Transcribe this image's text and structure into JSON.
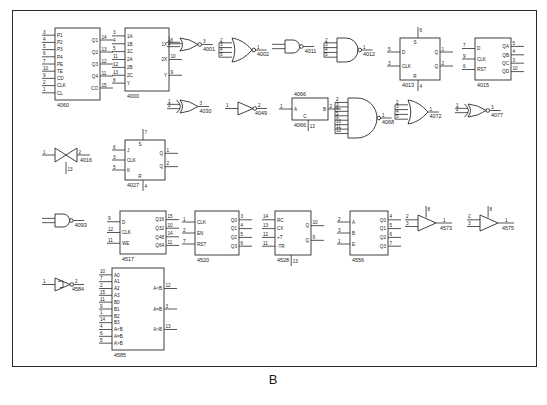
{
  "figure": {
    "caption": "B"
  },
  "components": [
    {
      "id": "u4060",
      "part": "4060",
      "type": "ic-block",
      "x": 55,
      "y": 28,
      "w": 45,
      "h": 72,
      "left_pins": [
        {
          "num": "3",
          "name": "P1"
        },
        {
          "num": "4",
          "name": "P2"
        },
        {
          "num": "5",
          "name": "P3"
        },
        {
          "num": "6",
          "name": "P4"
        },
        {
          "num": "7",
          "name": "PE"
        },
        {
          "num": "10",
          "name": "TE"
        },
        {
          "num": "9",
          "name": "CD"
        },
        {
          "num": "2",
          "name": "CLK"
        },
        {
          "num": "1",
          "name": "CL"
        }
      ],
      "right_pins": [
        {
          "num": "14",
          "name": "Q1"
        },
        {
          "num": "13",
          "name": "Q2"
        },
        {
          "num": "12",
          "name": "Q3"
        },
        {
          "num": "11",
          "name": "Q4"
        },
        {
          "num": "15",
          "name": "CO"
        }
      ]
    },
    {
      "id": "u4000",
      "part": "4000",
      "type": "ic-block",
      "x": 125,
      "y": 28,
      "w": 44,
      "h": 63,
      "left_pins": [
        {
          "num": "3",
          "name": "1A"
        },
        {
          "num": "4",
          "name": "1B"
        },
        {
          "num": "5",
          "name": "1C"
        },
        {
          "num": "11",
          "name": "2A"
        },
        {
          "num": "12",
          "name": "2B"
        },
        {
          "num": "13",
          "name": "2C"
        },
        {
          "num": "8",
          "name": "Y"
        }
      ],
      "right_pins": [
        {
          "num": "6",
          "name": "1X"
        },
        {
          "num": "10",
          "name": "2X"
        },
        {
          "num": "9",
          "name": "Y"
        }
      ]
    },
    {
      "id": "u4001",
      "part": "4001",
      "type": "nor2",
      "x": 180,
      "y": 38,
      "inputs": [
        "1",
        "2"
      ],
      "outputs": [
        "3"
      ]
    },
    {
      "id": "u4002",
      "part": "4002",
      "type": "nor4",
      "x": 232,
      "y": 38,
      "inputs": [
        "2",
        "3",
        "4",
        "5"
      ],
      "outputs": [
        "1"
      ]
    },
    {
      "id": "u4011",
      "part": "4011",
      "type": "nand2",
      "x": 285,
      "y": 40,
      "inputs": [
        "",
        ""
      ],
      "outputs": [
        ""
      ]
    },
    {
      "id": "u4012",
      "part": "4012",
      "type": "nand4",
      "x": 337,
      "y": 38,
      "inputs": [
        "2",
        "3",
        "4",
        "5"
      ],
      "outputs": [
        "1"
      ]
    },
    {
      "id": "u4013",
      "part": "4013",
      "type": "ff-block",
      "x": 400,
      "y": 38,
      "w": 40,
      "h": 42,
      "top_pins": [
        {
          "num": "6",
          "name": "S"
        }
      ],
      "bottom_pins": [
        {
          "num": "4",
          "name": "R"
        }
      ],
      "left_pins": [
        {
          "num": "5",
          "name": "D"
        },
        {
          "num": "3",
          "name": "CLK"
        }
      ],
      "right_pins": [
        {
          "num": "1",
          "name": "Q"
        },
        {
          "num": "2",
          "name": "Q"
        }
      ]
    },
    {
      "id": "u4015",
      "part": "4015",
      "type": "ic-block",
      "x": 475,
      "y": 38,
      "w": 36,
      "h": 42,
      "left_pins": [
        {
          "num": "7",
          "name": "D"
        },
        {
          "num": "9",
          "name": "CLK"
        },
        {
          "num": "6",
          "name": "RST"
        }
      ],
      "right_pins": [
        {
          "num": "5",
          "name": "QA"
        },
        {
          "num": "4",
          "name": "QB"
        },
        {
          "num": "3",
          "name": "QC"
        },
        {
          "num": "10",
          "name": "QD"
        }
      ]
    },
    {
      "id": "u4030",
      "part": "4030",
      "type": "xor2",
      "x": 180,
      "y": 100,
      "inputs": [
        "1",
        "2"
      ],
      "outputs": [
        "3"
      ]
    },
    {
      "id": "u4049",
      "part": "4049",
      "type": "inverter",
      "x": 238,
      "y": 102,
      "inputs": [
        "1"
      ],
      "outputs": [
        "2"
      ]
    },
    {
      "id": "u4066",
      "part": "4066",
      "type": "switch-block",
      "x": 292,
      "y": 98,
      "w": 36,
      "h": 22,
      "left_pins": [
        {
          "num": "1",
          "name": "A"
        }
      ],
      "right_pins": [
        {
          "num": "2",
          "name": "B"
        }
      ],
      "bottom_pins": [
        {
          "num": "13",
          "name": "C"
        }
      ]
    },
    {
      "id": "u4068",
      "part": "4068",
      "type": "nand8",
      "x": 348,
      "y": 98,
      "inputs": [
        "2",
        "3",
        "4",
        "5",
        "9",
        "10",
        "11",
        "12"
      ],
      "outputs": [
        "1"
      ]
    },
    {
      "id": "u4072",
      "part": "4072",
      "type": "or4",
      "x": 408,
      "y": 100,
      "inputs": [
        "2",
        "3",
        "4",
        "5"
      ],
      "outputs": [
        "1"
      ]
    },
    {
      "id": "u4077",
      "part": "4077",
      "type": "xnor2",
      "x": 468,
      "y": 104,
      "inputs": [
        "1",
        "2"
      ],
      "outputs": [
        "3"
      ]
    },
    {
      "id": "u4016",
      "part": "4016",
      "type": "tgate",
      "x": 55,
      "y": 148,
      "inputs": [
        "1"
      ],
      "outputs": [
        "2"
      ],
      "ctrl": "13"
    },
    {
      "id": "u4027",
      "part": "4027",
      "type": "ff-block",
      "x": 125,
      "y": 140,
      "w": 40,
      "h": 40,
      "top_pins": [
        {
          "num": "7",
          "name": "S"
        }
      ],
      "bottom_pins": [
        {
          "num": "4",
          "name": "R"
        }
      ],
      "left_pins": [
        {
          "num": "6",
          "name": "J"
        },
        {
          "num": "3",
          "name": "CLK"
        },
        {
          "num": "5",
          "name": "K"
        }
      ],
      "right_pins": [
        {
          "num": "1",
          "name": "Q"
        },
        {
          "num": "2",
          "name": "Q"
        }
      ]
    },
    {
      "id": "u4093",
      "part": "4093",
      "type": "nand2",
      "x": 55,
      "y": 214,
      "inputs": [
        "",
        ""
      ],
      "outputs": [
        ""
      ]
    },
    {
      "id": "u4517",
      "part": "4517",
      "type": "ic-block",
      "x": 120,
      "y": 211,
      "w": 46,
      "h": 43,
      "left_pins": [
        {
          "num": "9",
          "name": "D"
        },
        {
          "num": "12",
          "name": "CLK"
        },
        {
          "num": "11",
          "name": "WE"
        }
      ],
      "right_pins": [
        {
          "num": "15",
          "name": "Q16"
        },
        {
          "num": "10",
          "name": "Q32"
        },
        {
          "num": "14",
          "name": "Q48"
        },
        {
          "num": "11",
          "name": "Q64"
        }
      ]
    },
    {
      "id": "u4520",
      "part": "4520",
      "type": "ic-block",
      "x": 195,
      "y": 211,
      "w": 44,
      "h": 44,
      "left_pins": [
        {
          "num": "1",
          "name": "CLK"
        },
        {
          "num": "2",
          "name": "EN"
        },
        {
          "num": "7",
          "name": "RST"
        }
      ],
      "right_pins": [
        {
          "num": "3",
          "name": "Q0"
        },
        {
          "num": "4",
          "name": "Q1"
        },
        {
          "num": "5",
          "name": "Q2"
        },
        {
          "num": "6",
          "name": "Q3"
        }
      ]
    },
    {
      "id": "u4528",
      "part": "4528",
      "type": "ic-block",
      "x": 275,
      "y": 211,
      "w": 36,
      "h": 44,
      "left_pins": [
        {
          "num": "14",
          "name": "RC"
        },
        {
          "num": "13",
          "name": "CX"
        },
        {
          "num": "12",
          "name": "+T"
        },
        {
          "num": "11",
          "name": "-TR"
        }
      ],
      "right_pins": [
        {
          "num": "10",
          "name": "Q"
        },
        {
          "num": "9",
          "name": "Q"
        }
      ],
      "bottom_pins": [
        {
          "num": "13",
          "name": ""
        }
      ]
    },
    {
      "id": "u4556",
      "part": "4556",
      "type": "ic-block",
      "x": 350,
      "y": 211,
      "w": 38,
      "h": 44,
      "left_pins": [
        {
          "num": "2",
          "name": "A"
        },
        {
          "num": "3",
          "name": "B"
        },
        {
          "num": "1",
          "name": "E"
        }
      ],
      "right_pins": [
        {
          "num": "4",
          "name": "Q0"
        },
        {
          "num": "5",
          "name": "Q1"
        },
        {
          "num": "6",
          "name": "Q2"
        },
        {
          "num": "7",
          "name": "Q3"
        }
      ]
    },
    {
      "id": "u4573",
      "part": "4573",
      "type": "opamp",
      "x": 418,
      "y": 215,
      "inputs": [
        "2",
        "3"
      ],
      "outputs": [
        "1"
      ],
      "supply": "8"
    },
    {
      "id": "u4575",
      "part": "4575",
      "type": "opamp",
      "x": 480,
      "y": 215,
      "inputs": [
        "2",
        "3"
      ],
      "outputs": [
        "1"
      ],
      "supply": "8"
    },
    {
      "id": "u4584",
      "part": "4584",
      "type": "schmitt",
      "x": 55,
      "y": 278,
      "inputs": [
        "1"
      ],
      "outputs": [
        "2"
      ]
    },
    {
      "id": "u4585",
      "part": "4585",
      "type": "ic-block",
      "x": 112,
      "y": 268,
      "w": 52,
      "h": 82,
      "left_pins": [
        {
          "num": "10",
          "name": "A0"
        },
        {
          "num": "7",
          "name": "A1"
        },
        {
          "num": "2",
          "name": "A2"
        },
        {
          "num": "15",
          "name": "A3"
        },
        {
          "num": "11",
          "name": "B0"
        },
        {
          "num": "9",
          "name": "B1"
        },
        {
          "num": "1",
          "name": "B2"
        },
        {
          "num": "14",
          "name": "B3"
        },
        {
          "num": "4",
          "name": "A<B"
        },
        {
          "num": "6",
          "name": "A=B"
        },
        {
          "num": "5",
          "name": "A>B"
        }
      ],
      "right_pins": [
        {
          "num": "12",
          "name": "A<B"
        },
        {
          "num": "3",
          "name": "A=B"
        },
        {
          "num": "13",
          "name": "A>B"
        }
      ]
    }
  ],
  "colors": {
    "ink": "#2b2b2b",
    "paper": "#ffffff",
    "border": "#2a2a2a"
  }
}
